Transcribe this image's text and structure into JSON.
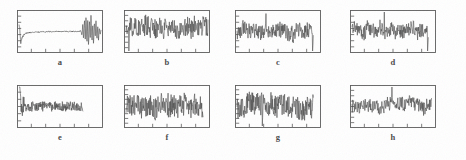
{
  "figure": {
    "title": "",
    "layout": "2 rows x 4 columns of signal plots",
    "background_color": "#ffffff",
    "trace_color": "#4d4d4d",
    "axis_color": "#5a5a5a"
  },
  "panels": [
    {
      "id": "a",
      "caption": "a",
      "x": 17,
      "y": 10,
      "w": 86,
      "h": 43,
      "caption_y": 58,
      "x_ticks": 5,
      "y_ticks": 6,
      "data_start_frac": 0.0,
      "data_end_frac": 1.0
    },
    {
      "id": "b",
      "caption": "b",
      "x": 124,
      "y": 10,
      "w": 86,
      "h": 43,
      "caption_y": 58,
      "x_ticks": 5,
      "y_ticks": 7,
      "data_start_frac": 0.0,
      "data_end_frac": 1.0
    },
    {
      "id": "c",
      "caption": "c",
      "x": 235,
      "y": 10,
      "w": 86,
      "h": 43,
      "caption_y": 58,
      "x_ticks": 5,
      "y_ticks": 6,
      "data_start_frac": 0.0,
      "data_end_frac": 0.93
    },
    {
      "id": "d",
      "caption": "d",
      "x": 350,
      "y": 10,
      "w": 86,
      "h": 43,
      "caption_y": 58,
      "x_ticks": 5,
      "y_ticks": 6,
      "data_start_frac": 0.0,
      "data_end_frac": 0.93
    },
    {
      "id": "e",
      "caption": "e",
      "x": 17,
      "y": 85,
      "w": 86,
      "h": 43,
      "caption_y": 133,
      "x_ticks": 5,
      "y_ticks": 5,
      "data_start_frac": 0.0,
      "data_end_frac": 0.78
    },
    {
      "id": "f",
      "caption": "f",
      "x": 124,
      "y": 85,
      "w": 86,
      "h": 43,
      "caption_y": 133,
      "x_ticks": 5,
      "y_ticks": 8,
      "data_start_frac": 0.0,
      "data_end_frac": 0.94
    },
    {
      "id": "g",
      "caption": "g",
      "x": 235,
      "y": 85,
      "w": 86,
      "h": 43,
      "caption_y": 133,
      "x_ticks": 5,
      "y_ticks": 8,
      "data_start_frac": 0.0,
      "data_end_frac": 0.93
    },
    {
      "id": "h",
      "caption": "h",
      "x": 350,
      "y": 85,
      "w": 86,
      "h": 43,
      "caption_y": 133,
      "x_ticks": 5,
      "y_ticks": 7,
      "data_start_frac": 0.0,
      "data_end_frac": 0.97
    }
  ],
  "chart_data": {
    "type": "line",
    "title": "",
    "xlabel": "",
    "ylabel": "",
    "grid": false,
    "legend": "none",
    "panels": [
      {
        "name": "a",
        "xlim": [
          0,
          1
        ],
        "ylim": [
          -1,
          1
        ],
        "shape": "damped-settling signal: sharp negative dip near the start, long quiet flat plateau, then a large high-amplitude burst near the right end",
        "seed": 11,
        "profile": "burst",
        "base_amp": 0.055,
        "values": [
          0.42,
          0.1,
          -0.62,
          -0.4,
          -0.3,
          -0.22,
          -0.16,
          -0.12,
          -0.1,
          -0.08,
          -0.07,
          -0.06,
          -0.06,
          -0.05,
          -0.05,
          -0.05,
          -0.04,
          -0.04,
          -0.04,
          -0.04,
          -0.03,
          -0.03,
          -0.03,
          -0.03,
          -0.03,
          -0.02,
          -0.02,
          -0.02,
          -0.02,
          -0.02,
          -0.02,
          -0.02,
          -0.02,
          -0.02,
          -0.02,
          -0.01,
          -0.01,
          -0.01,
          -0.01,
          -0.01,
          -0.01,
          -0.01,
          -0.01,
          -0.01,
          -0.01,
          0.0,
          0.0,
          0.0,
          0.0,
          0.0,
          0.0,
          0.0,
          0.0,
          0.0,
          0.0,
          0.0,
          0.0,
          0.0,
          0.0,
          0.0,
          0.0,
          0.0,
          0.0,
          0.0,
          0.0,
          0.0,
          0.0,
          0.0,
          0.0,
          0.0,
          0.0,
          0.0,
          0.0,
          0.0,
          0.0,
          0.05,
          -0.18,
          0.35,
          -0.55,
          0.7,
          -0.45,
          0.85,
          -0.72,
          0.5,
          -0.88,
          0.62,
          -0.35,
          0.92,
          -0.6,
          0.4,
          -0.75,
          0.55,
          -0.3,
          0.66,
          -0.48,
          0.28,
          -0.4,
          0.22,
          -0.15,
          0.08
        ]
      },
      {
        "name": "b",
        "xlim": [
          0,
          1
        ],
        "ylim": [
          -1,
          1
        ],
        "shape": "dense broadband noise filling most of the upper two-thirds of the frame, a sharp downward spike near the left edge, amplitude roughly constant across the record",
        "seed": 23,
        "profile": "noise",
        "base_amp": 0.5,
        "mean": 0.22
      },
      {
        "name": "c",
        "xlim": [
          0,
          1
        ],
        "ylim": [
          -1,
          1
        ],
        "shape": "broadband noise centered mid-frame with a few larger excursions in the middle and a deep downward spike at the right end of the record",
        "seed": 37,
        "profile": "noise",
        "base_amp": 0.4,
        "mean": 0.05
      },
      {
        "name": "d",
        "xlim": [
          0,
          1
        ],
        "ylim": [
          -1,
          1
        ],
        "shape": "broadband noise similar to c, with a pronounced tall upward spike slightly left of centre and a deep downward spike terminating the trace",
        "seed": 53,
        "profile": "noise",
        "base_amp": 0.38,
        "mean": 0.05
      },
      {
        "name": "e",
        "xlim": [
          0,
          1
        ],
        "ylim": [
          -1,
          1
        ],
        "shape": "very large transient spike at the extreme left that saturates the frame, followed by a lower-amplitude noisy band occupying only the left three-quarters of the panel",
        "seed": 67,
        "profile": "spike-then-noise",
        "base_amp": 0.26,
        "mean": 0.0
      },
      {
        "name": "f",
        "xlim": [
          0,
          1
        ],
        "ylim": [
          -1,
          1
        ],
        "shape": "very dense high-amplitude broadband noise nearly filling the whole frame height, uniform across the record",
        "seed": 83,
        "profile": "noise",
        "base_amp": 0.62,
        "mean": 0.0
      },
      {
        "name": "g",
        "xlim": [
          0,
          1
        ],
        "ylim": [
          -1,
          1
        ],
        "shape": "dense high-amplitude broadband noise like f, with one isolated deep downward excursion near one-third along the record",
        "seed": 97,
        "profile": "noise",
        "base_amp": 0.58,
        "mean": 0.02
      },
      {
        "name": "h",
        "xlim": [
          0,
          1
        ],
        "ylim": [
          -1,
          1
        ],
        "shape": "moderate broadband noise with a single prominent tall upward spike near the centre of the record",
        "seed": 113,
        "profile": "noise",
        "base_amp": 0.34,
        "mean": 0.02
      }
    ]
  }
}
